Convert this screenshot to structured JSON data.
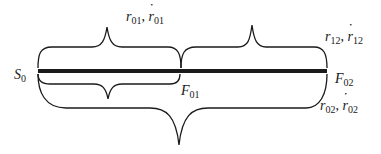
{
  "diagram": {
    "type": "brace-segment-diagram",
    "points": {
      "start": {
        "symbol": "S",
        "sub": "0"
      },
      "mid": {
        "symbol": "F",
        "sub": "01"
      },
      "end": {
        "symbol": "F",
        "sub": "02"
      }
    },
    "braces": {
      "upper_left": {
        "r": "r",
        "rstar": "r",
        "sub": "01",
        "sep": ",",
        "spans": "S0–F01"
      },
      "upper_right": {
        "r": "r",
        "rstar": "r",
        "sub": "12",
        "sep": ",",
        "spans": "F01–F02"
      },
      "lower_short": {
        "spans": "S0–F01"
      },
      "lower_long": {
        "r": "r",
        "rstar": "r",
        "sub": "02",
        "sep": ",",
        "spans": "S0–F02"
      }
    },
    "colors": {
      "ink": "#1a1a1a",
      "background": "#ffffff"
    }
  }
}
